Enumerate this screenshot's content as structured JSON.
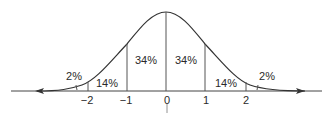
{
  "diagram": {
    "type": "normal-distribution",
    "axis": {
      "ticks": [
        {
          "value": "−2",
          "x": 88
        },
        {
          "value": "−1",
          "x": 127
        },
        {
          "value": "0",
          "x": 166
        },
        {
          "value": "1",
          "x": 205
        },
        {
          "value": "2",
          "x": 246
        }
      ]
    },
    "regions": [
      {
        "label": "2%",
        "x": 74,
        "y": 80
      },
      {
        "label": "14%",
        "x": 107,
        "y": 87
      },
      {
        "label": "34%",
        "x": 146,
        "y": 64
      },
      {
        "label": "34%",
        "x": 186,
        "y": 64
      },
      {
        "label": "14%",
        "x": 226,
        "y": 87
      },
      {
        "label": "2%",
        "x": 267,
        "y": 80
      }
    ],
    "colors": {
      "line": "#333333",
      "text": "#2a2a2a",
      "background": "#ffffff"
    }
  }
}
